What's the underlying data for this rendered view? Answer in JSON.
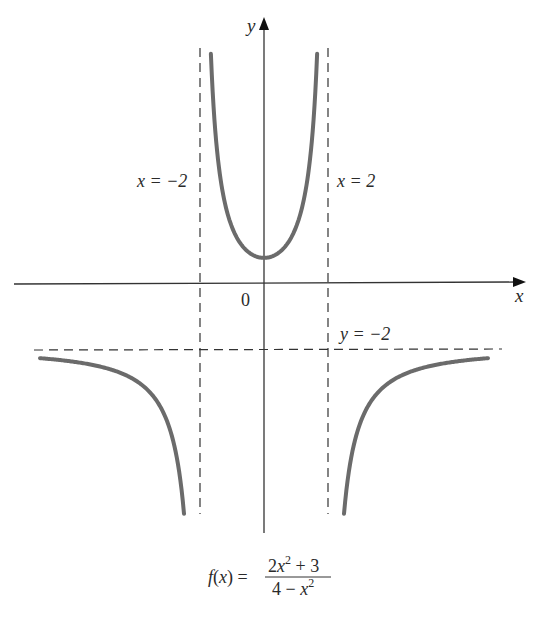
{
  "chart_data": {
    "type": "line",
    "title": "",
    "function": "f(x) = (2x^2 + 3) / (4 - x^2)",
    "xlabel": "x",
    "ylabel": "y",
    "origin_label": "0",
    "asymptotes": [
      {
        "kind": "vertical",
        "value": -2,
        "label": "x = −2"
      },
      {
        "kind": "vertical",
        "value": 2,
        "label": "x = 2"
      },
      {
        "kind": "horizontal",
        "value": -2,
        "label": "y = −2"
      }
    ],
    "xlim": [
      -7.7,
      8.2
    ],
    "ylim": [
      -7.5,
      8.0
    ],
    "grid": false,
    "series": [
      {
        "name": "left branch",
        "x_range": [
          -7.0,
          -2.5
        ]
      },
      {
        "name": "middle branch",
        "x_range": [
          -1.66,
          1.66
        ]
      },
      {
        "name": "right branch",
        "x_range": [
          2.5,
          7.0
        ]
      }
    ],
    "sample_points": [
      {
        "x": -7,
        "y": -2.24
      },
      {
        "x": -4,
        "y": -2.92
      },
      {
        "x": -3,
        "y": -4.2
      },
      {
        "x": -2.5,
        "y": -6.89
      },
      {
        "x": -1.5,
        "y": 3.43
      },
      {
        "x": -1,
        "y": 1.67
      },
      {
        "x": 0,
        "y": 0.75
      },
      {
        "x": 1,
        "y": 1.67
      },
      {
        "x": 1.5,
        "y": 3.43
      },
      {
        "x": 2.5,
        "y": -6.89
      },
      {
        "x": 3,
        "y": -4.2
      },
      {
        "x": 4,
        "y": -2.92
      },
      {
        "x": 7,
        "y": -2.24
      }
    ],
    "curve_color": "#6b6b6b",
    "axis_color": "#333333"
  },
  "labels": {
    "x_axis": "x",
    "y_axis": "y",
    "origin": "0",
    "asym_left": "x = −2",
    "asym_right": "x = 2",
    "asym_horizontal": "y = −2",
    "formula_lhs": "f(x) =",
    "formula_num": "2x",
    "formula_num_exp": "2",
    "formula_num_tail": " + 3",
    "formula_den": "4 − x",
    "formula_den_exp": "2"
  }
}
